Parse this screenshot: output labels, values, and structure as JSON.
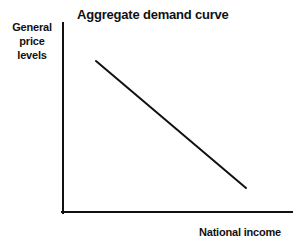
{
  "chart_data": {
    "type": "line",
    "title": "Aggregate demand curve",
    "xlabel": "National income",
    "ylabel": "General price levels",
    "ylabel_lines": [
      "General",
      "price",
      "levels"
    ],
    "grid": false,
    "legend": null,
    "xlim": [
      0,
      100
    ],
    "ylim": [
      0,
      100
    ],
    "xticks": [],
    "yticks": [],
    "axis_color": "#111111",
    "line_color": "#111111",
    "background_color": "#ffffff",
    "series": [
      {
        "name": "Aggregate demand",
        "x": [
          15,
          82
        ],
        "y": [
          80,
          13
        ],
        "points_px": [
          [
            96,
            61
          ],
          [
            246,
            188
          ]
        ]
      }
    ],
    "annotations": []
  },
  "figure": {
    "title": "Aggregate demand curve",
    "x_axis_label": "National income",
    "y_axis_label_lines": [
      "General",
      "price",
      "levels"
    ]
  }
}
